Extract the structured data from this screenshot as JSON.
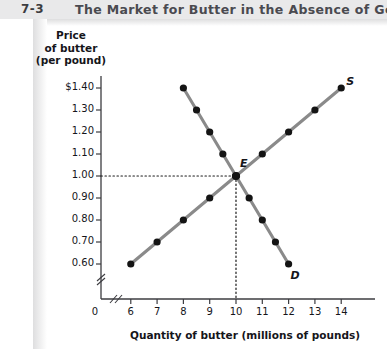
{
  "header": {
    "figure_word": "FIGURE",
    "figure_number": "7-3",
    "title": "The Market for Butter in the Absence of Government"
  },
  "chart_data": {
    "type": "line",
    "title": "The Market for Butter in the Absence of Government",
    "xlabel": "Quantity of butter (millions of pounds)",
    "ylabel": "Price of butter (per pound)",
    "xlim": [
      5.4,
      14.6
    ],
    "ylim": [
      0.54,
      1.46
    ],
    "xticks": [
      "6",
      "7",
      "8",
      "9",
      "10",
      "11",
      "12",
      "13",
      "14"
    ],
    "xtick_values": [
      6,
      7,
      8,
      9,
      10,
      11,
      12,
      13,
      14
    ],
    "origin_label": "0",
    "yticks": [
      "$1.40",
      "1.30",
      "1.20",
      "1.10",
      "1.00",
      "0.90",
      "0.80",
      "0.70",
      "0.60"
    ],
    "ytick_values": [
      1.4,
      1.3,
      1.2,
      1.1,
      1.0,
      0.9,
      0.8,
      0.7,
      0.6
    ],
    "axis_break": true,
    "grid": false,
    "legend": "none",
    "series": [
      {
        "name": "S",
        "label": "S",
        "description": "Supply curve",
        "x": [
          6,
          7,
          8,
          9,
          10,
          11,
          12,
          13,
          14
        ],
        "values": [
          0.6,
          0.7,
          0.8,
          0.9,
          1.0,
          1.1,
          1.2,
          1.3,
          1.4
        ],
        "color": "#8a8a8a",
        "marker_color": "#141414"
      },
      {
        "name": "D",
        "label": "D",
        "description": "Demand curve",
        "x": [
          8,
          8.5,
          9,
          9.5,
          10,
          10.5,
          11,
          11.5,
          12
        ],
        "values": [
          1.4,
          1.3,
          1.2,
          1.1,
          1.0,
          0.9,
          0.8,
          0.7,
          0.6
        ],
        "color": "#8a8a8a",
        "marker_color": "#141414"
      }
    ],
    "annotations": [
      {
        "label": "E",
        "name": "equilibrium-point",
        "x": 10,
        "y": 1.0,
        "guides": [
          "horizontal-dotted-to-y-axis",
          "vertical-dotted-to-x-axis"
        ]
      }
    ]
  },
  "colors": {
    "header_band": "#e9e9ea",
    "figure_word": "#bcbcc0",
    "title_text": "#4a4a50",
    "curve": "#8a8a8a",
    "marker": "#141414",
    "axis": "#3c3c40"
  }
}
